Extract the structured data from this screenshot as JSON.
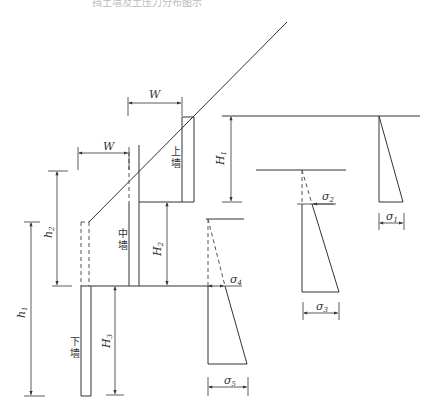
{
  "caption": "挡土墙及土压力分布图示",
  "walls": {
    "upper": {
      "label": "上墙"
    },
    "middle": {
      "label": "中墙"
    },
    "lower": {
      "label": "下墙"
    }
  },
  "dimensions": {
    "W_top": "W",
    "W_mid": "W",
    "H1": "H",
    "H1_sub": "1",
    "H2": "H",
    "H2_sub": "2",
    "H3": "H",
    "H3_sub": "3",
    "h1": "h",
    "h1_sub": "1",
    "h2": "h",
    "h2_sub": "2"
  },
  "stresses": {
    "s1": "σ",
    "s1_sub": "1",
    "s2": "σ",
    "s2_sub": "2",
    "s3": "σ",
    "s3_sub": "3",
    "s4": "σ",
    "s4_sub": "4",
    "s5": "σ",
    "s5_sub": "5"
  }
}
